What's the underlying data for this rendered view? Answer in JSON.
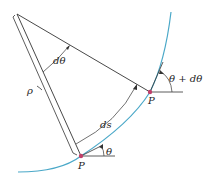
{
  "diagram": {
    "labels": {
      "d_theta": "dθ",
      "rho": "ρ",
      "ds": "ds",
      "theta": "θ",
      "theta_plus_dtheta": "θ + dθ",
      "point_upper": "P",
      "point_lower": "P"
    },
    "colors": {
      "curve": "#4aa8c8",
      "point": "#c0406a",
      "line": "#333333"
    }
  }
}
